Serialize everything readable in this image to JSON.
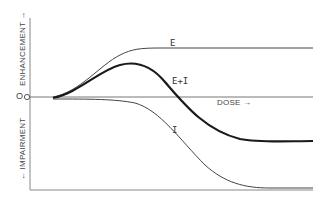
{
  "diagram": {
    "origin_label": "O",
    "y_axis_upper_label": "ENHANCEMENT →",
    "y_axis_lower_label": "← IMPAIRMENT",
    "x_axis_label": "DOSE →",
    "curves": [
      {
        "id": "E",
        "label": "E",
        "stroke": "#444444",
        "width": 1
      },
      {
        "id": "EI",
        "label": "E+I",
        "stroke": "#1a1a1a",
        "width": 2.2
      },
      {
        "id": "I",
        "label": "I",
        "stroke": "#444444",
        "width": 1
      }
    ]
  }
}
